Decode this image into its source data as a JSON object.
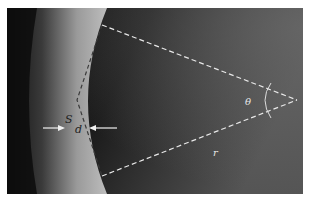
{
  "diagram": {
    "type": "geometry-over-photo",
    "colors": {
      "background_dark": "#151515",
      "background_right": "#4a4a4a",
      "limb_bright": "#b5b5b5",
      "limb_outer": "#1a1a1a",
      "dashed_line": "#e8e8e8",
      "arrow": "#f0f0f0"
    },
    "labels": {
      "s": "S",
      "d": "d",
      "theta": "θ",
      "r": "r"
    },
    "geometry": {
      "vertex": [
        290,
        92
      ],
      "upper_end": [
        95,
        17
      ],
      "lower_end": [
        95,
        168
      ],
      "chord_top": [
        95,
        17
      ],
      "chord_mid": [
        70,
        92
      ],
      "chord_bottom": [
        95,
        168
      ],
      "arc_center_offset": 20
    }
  }
}
